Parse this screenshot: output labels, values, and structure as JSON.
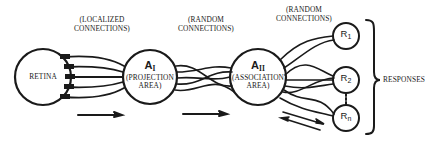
{
  "diagram": {
    "title": "",
    "colors": {
      "stroke": "#1a1a1a",
      "background": "#ffffff"
    },
    "connection_labels": [
      {
        "id": "localized",
        "line1": "(LOCALIZED",
        "line2": "CONNECTIONS)"
      },
      {
        "id": "random1",
        "line1": "(RANDOM",
        "line2": "CONNECTIONS)"
      },
      {
        "id": "random2",
        "line1": "(RANDOM",
        "line2": "CONNECTIONS)"
      }
    ],
    "nodes": {
      "retina": {
        "label": "RETINA"
      },
      "a1": {
        "main": "A",
        "sub": "I",
        "line1": "(PROJECTION",
        "line2": "AREA)"
      },
      "a2": {
        "main": "A",
        "sub": "II",
        "line1": "(ASSOCIATION",
        "line2": "AREA)"
      },
      "r1": {
        "main": "R",
        "sub": "1"
      },
      "r2": {
        "main": "R",
        "sub": "2"
      },
      "rn": {
        "main": "R",
        "sub": "n"
      }
    },
    "responses_label": "RESPONSES",
    "edges": [
      {
        "from": "retina",
        "to": "a1",
        "type": "localized",
        "count": 5
      },
      {
        "from": "a1",
        "to": "a2",
        "type": "random",
        "count": 5
      },
      {
        "from": "a2",
        "to": "r1",
        "type": "random"
      },
      {
        "from": "a2",
        "to": "r2",
        "type": "random"
      },
      {
        "from": "a2",
        "to": "rn",
        "type": "random"
      },
      {
        "from": "r2",
        "to": "rn",
        "type": "dotted"
      }
    ],
    "flow_arrows": [
      {
        "position": "below retina-a1",
        "direction": "forward"
      },
      {
        "position": "below a1-a2",
        "direction": "forward"
      },
      {
        "position": "below a2-responses",
        "direction": "bidirectional"
      }
    ]
  }
}
